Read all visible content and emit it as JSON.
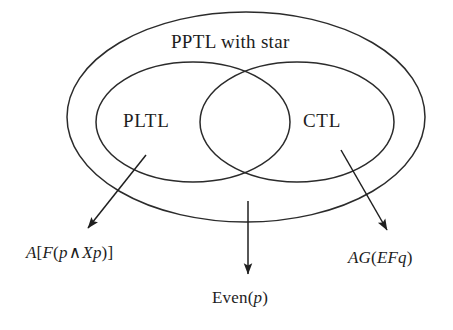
{
  "figure": {
    "type": "euler-venn-diagram",
    "title_text": "PPTL with star",
    "background_color": "#ffffff",
    "stroke_color": "#2b2b2b"
  },
  "sets": {
    "outer": {
      "label": "PPTL with star",
      "name": "PPTL with star",
      "shape": "ellipse",
      "cx": 246,
      "cy": 117,
      "rx": 179,
      "ry": 105
    },
    "left": {
      "label": "PLTL",
      "name": "PLTL",
      "shape": "ellipse",
      "cx": 193,
      "cy": 122,
      "rx": 97,
      "ry": 60
    },
    "right": {
      "label": "CTL",
      "name": "CTL",
      "shape": "ellipse",
      "cx": 297,
      "cy": 122,
      "rx": 97,
      "ry": 60
    }
  },
  "annotations": [
    {
      "id": "left",
      "text": "A[F(p ∧ Xp)]",
      "parts": [
        {
          "t": "A",
          "style": "italic"
        },
        {
          "t": "[",
          "style": "upright"
        },
        {
          "t": "F",
          "style": "italic"
        },
        {
          "t": "(",
          "style": "upright"
        },
        {
          "t": "p",
          "style": "italic"
        },
        {
          "t": "∧",
          "style": "operator"
        },
        {
          "t": "X",
          "style": "italic"
        },
        {
          "t": "p",
          "style": "italic"
        },
        {
          "t": ")]",
          "style": "upright"
        }
      ],
      "points_to": "PLTL",
      "arrow": {
        "x1": 146,
        "y1": 155,
        "x2": 86,
        "y2": 231
      }
    },
    {
      "id": "center",
      "text": "Even(p)",
      "parts": [
        {
          "t": "Even(",
          "style": "upright"
        },
        {
          "t": "p",
          "style": "italic"
        },
        {
          "t": ")",
          "style": "upright"
        }
      ],
      "points_to": "PPTL with star",
      "arrow": {
        "x1": 248,
        "y1": 201,
        "x2": 248,
        "y2": 277
      }
    },
    {
      "id": "right",
      "text": "AG(EFq)",
      "parts": [
        {
          "t": "AG",
          "style": "italic"
        },
        {
          "t": "(",
          "style": "upright"
        },
        {
          "t": "EF",
          "style": "italic"
        },
        {
          "t": "q",
          "style": "italic"
        },
        {
          "t": ")",
          "style": "upright"
        }
      ],
      "points_to": "CTL",
      "arrow": {
        "x1": 341,
        "y1": 150,
        "x2": 389,
        "y2": 233
      }
    }
  ],
  "labels": {
    "outer": "PPTL with star",
    "left_set": "PLTL",
    "right_set": "CTL",
    "formula_left_a": "A",
    "formula_left_b": "[",
    "formula_left_c": "F",
    "formula_left_d": "(",
    "formula_left_e": "p",
    "formula_left_f": "∧",
    "formula_left_g": "X",
    "formula_left_h": "p",
    "formula_left_i": ")]",
    "formula_center_a": "Even(",
    "formula_center_b": "p",
    "formula_center_c": ")",
    "formula_right_a": "AG",
    "formula_right_b": "(",
    "formula_right_c": "EF",
    "formula_right_d": "q",
    "formula_right_e": ")"
  }
}
